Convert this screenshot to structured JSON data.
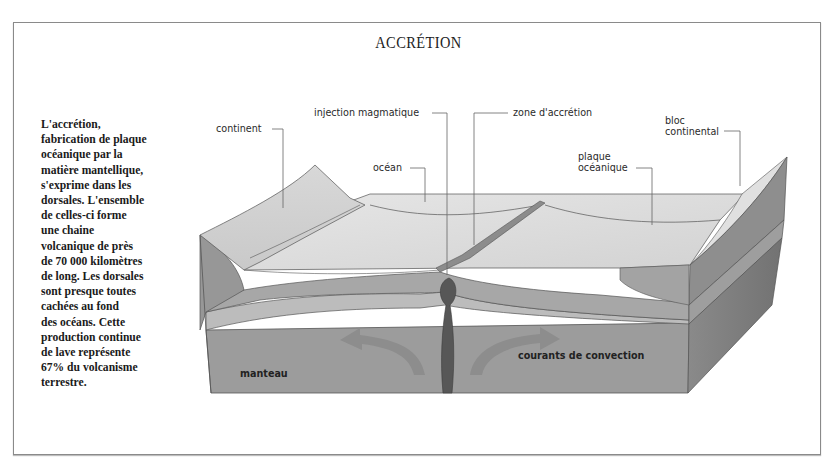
{
  "title": "ACCRÉTION",
  "description_lines": [
    "L'accrétion,",
    "fabrication de plaque",
    "océanique par la",
    "matière mantellique,",
    "s'exprime dans les",
    "dorsales. L'ensemble",
    "de celles-ci forme",
    "une chaine",
    "volcanique de près",
    "de 70 000 kilomètres",
    "de long. Les dorsales",
    "sont presque toutes",
    "cachées au fond",
    "des océans. Cette",
    "production continue",
    "de lave représente",
    "67% du volcanisme",
    "terrestre."
  ],
  "labels": {
    "continent": "continent",
    "injection": "injection magmatique",
    "zone": "zone d'accrétion",
    "ocean": "océan",
    "plaque_line1": "plaque",
    "plaque_line2": "océanique",
    "bloc_line1": "bloc",
    "bloc_line2": "continental",
    "manteau": "manteau",
    "courants": "courants de convection"
  },
  "colors": {
    "surface": "#dcdcdc",
    "crust": "#a9a9a9",
    "lithosphere": "#bdbdbd",
    "mantle": "#9b9b9b",
    "magma": "#555555",
    "side_dark": "#7a7a7a",
    "arrow": "#8e8e8e"
  }
}
